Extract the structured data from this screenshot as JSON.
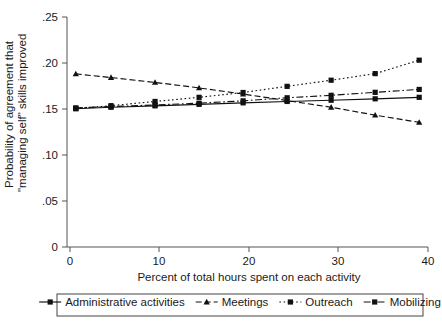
{
  "chart_data": {
    "type": "line",
    "title": "",
    "subtitle": "",
    "xlabel": "Percent of total hours spent on each activity",
    "ylabel": "Probability of agreement that\n\"managing self\" skills improved",
    "ylabel_line1": "Probability of agreement that",
    "ylabel_line2": "\"managing self\" skills improved",
    "x": [
      1,
      5,
      10,
      15,
      20,
      25,
      30,
      35,
      40
    ],
    "xlim": [
      0,
      41
    ],
    "ylim": [
      0,
      0.262
    ],
    "xticks": [
      0,
      10,
      20,
      30,
      40
    ],
    "xticklabels": [
      "0",
      "10",
      "20",
      "30",
      "40"
    ],
    "yticks": [
      0,
      0.05,
      0.1,
      0.15,
      0.2,
      0.25
    ],
    "yticklabels": [
      "0",
      ".05",
      ".10",
      ".15",
      ".20",
      ".25"
    ],
    "grid": false,
    "legend_position": "below",
    "series": [
      {
        "name": "Administrative activities",
        "linestyle": "solid",
        "marker": "square",
        "values": [
          0.1575,
          0.1592,
          0.1608,
          0.1625,
          0.1642,
          0.1658,
          0.1672,
          0.1688,
          0.1705
        ]
      },
      {
        "name": "Meetings",
        "linestyle": "dashed",
        "marker": "triangle",
        "values": [
          0.1972,
          0.193,
          0.1875,
          0.1812,
          0.1742,
          0.1668,
          0.1592,
          0.1502,
          0.142
        ]
      },
      {
        "name": "Outreach",
        "linestyle": "dotted",
        "marker": "square",
        "values": [
          0.1578,
          0.161,
          0.1658,
          0.1705,
          0.176,
          0.183,
          0.19,
          0.1975,
          0.2128
        ]
      },
      {
        "name": "Mobilizing",
        "linestyle": "dashdot",
        "marker": "square",
        "values": [
          0.1585,
          0.16,
          0.1618,
          0.1638,
          0.1665,
          0.17,
          0.1728,
          0.1762,
          0.1795
        ]
      }
    ]
  },
  "legend": {
    "entries": [
      {
        "label": "Administrative activities"
      },
      {
        "label": "Meetings"
      },
      {
        "label": "Outreach"
      },
      {
        "label": "Mobilizing"
      }
    ]
  },
  "colors": {
    "ink": "#111111",
    "axis": "#555555",
    "background": "#ffffff"
  }
}
